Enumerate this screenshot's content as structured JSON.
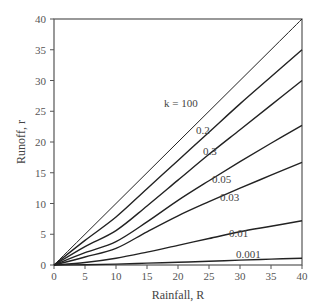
{
  "chart_data": {
    "type": "line",
    "title": "",
    "xlabel": "Rainfall, R",
    "ylabel": "Runoff, r",
    "xlim": [
      0,
      40
    ],
    "ylim": [
      0,
      40
    ],
    "xticks": [
      0,
      5,
      10,
      15,
      20,
      25,
      30,
      35,
      40
    ],
    "yticks": [
      0,
      5,
      10,
      15,
      20,
      25,
      30,
      35,
      40
    ],
    "grid": false,
    "legend": "inline curve labels",
    "x": [
      0,
      5,
      10,
      15,
      20,
      25,
      30,
      35,
      40
    ],
    "series": [
      {
        "name": "k = 100",
        "label": "k = 100",
        "values": [
          0,
          5,
          10,
          15,
          20,
          25,
          30,
          35,
          40
        ],
        "label_pos": [
          164,
          107
        ]
      },
      {
        "name": "0.2",
        "label": "0.2",
        "values": [
          0,
          4.0,
          7.8,
          12.4,
          17.0,
          21.6,
          26.2,
          30.6,
          35.0
        ],
        "label_pos": [
          196,
          134
        ]
      },
      {
        "name": "0.3",
        "label": "0.3",
        "values": [
          0,
          3.0,
          5.6,
          9.6,
          13.8,
          18.0,
          22.0,
          26.0,
          30.0
        ],
        "label_pos": [
          203,
          155
        ]
      },
      {
        "name": "0.05",
        "label": "0.05",
        "values": [
          0,
          2.0,
          3.8,
          7.0,
          10.5,
          13.7,
          16.8,
          19.8,
          22.7
        ],
        "label_pos": [
          212,
          183
        ]
      },
      {
        "name": "0.03",
        "label": "0.03",
        "values": [
          0,
          1.3,
          2.7,
          5.4,
          8.0,
          10.3,
          12.5,
          14.6,
          16.7
        ],
        "label_pos": [
          220,
          201
        ]
      },
      {
        "name": "0.01",
        "label": "0.01",
        "values": [
          0,
          0.4,
          1.1,
          2.1,
          3.2,
          4.3,
          5.4,
          6.3,
          7.2
        ],
        "label_pos": [
          229,
          237
        ]
      },
      {
        "name": "0.001",
        "label": "0.001",
        "values": [
          0,
          0.05,
          0.15,
          0.3,
          0.45,
          0.6,
          0.8,
          0.95,
          1.1
        ],
        "label_pos": [
          236,
          258
        ]
      }
    ]
  },
  "colors": {
    "axis": "#555555",
    "curve": "#222222",
    "text": "#444444",
    "background": "#ffffff"
  }
}
